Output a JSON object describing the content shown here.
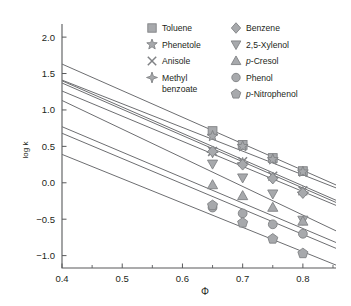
{
  "chart_data": {
    "type": "line",
    "title": "",
    "xlabel": "Φ",
    "ylabel": "log k",
    "xlim": [
      0.4,
      0.855
    ],
    "ylim": [
      -1.17,
      2.18
    ],
    "xticks": [
      0.4,
      0.5,
      0.6,
      0.7,
      0.8
    ],
    "xtick_labels": [
      "0.4",
      "0.5",
      "0.6",
      "0.7",
      "0.8"
    ],
    "xminor": [
      0.45,
      0.55,
      0.65,
      0.75,
      0.85
    ],
    "yticks": [
      -1.0,
      -0.5,
      0.0,
      0.5,
      1.0,
      1.5,
      2.0
    ],
    "ytick_labels": [
      "−1.0",
      "−0.5",
      "0.0",
      "0.5",
      "1.0",
      "1.5",
      "2.0"
    ],
    "grid": false,
    "legend_position": "top-right",
    "marker_x": [
      0.65,
      0.7,
      0.75,
      0.8
    ],
    "line_x_range": [
      0.4,
      0.855
    ],
    "series": [
      {
        "name": "Toluene",
        "marker": "square",
        "x": [
          0.65,
          0.7,
          0.75,
          0.8
        ],
        "values": [
          0.71,
          0.52,
          0.34,
          0.16
        ],
        "fit_endpoints": [
          1.63,
          -0.03
        ]
      },
      {
        "name": "Phenetole",
        "marker": "star",
        "x": [
          0.65,
          0.7,
          0.75,
          0.8
        ],
        "values": [
          0.64,
          0.5,
          0.32,
          0.15
        ],
        "fit_endpoints": [
          1.41,
          -0.07
        ]
      },
      {
        "name": "Anisole",
        "marker": "x",
        "x": [
          0.65,
          0.7,
          0.75,
          0.8
        ],
        "values": [
          0.43,
          0.29,
          0.09,
          -0.11
        ],
        "fit_endpoints": [
          1.4,
          -0.24
        ]
      },
      {
        "name": "Methyl benzoate",
        "marker": "four-point-star",
        "x": [
          0.65,
          0.7,
          0.75,
          0.8
        ],
        "values": [
          0.42,
          0.27,
          0.07,
          -0.13
        ],
        "fit_endpoints": [
          1.37,
          -0.27
        ]
      },
      {
        "name": "Benzene",
        "marker": "diamond",
        "x": [
          0.65,
          0.7,
          0.75,
          0.8
        ],
        "values": [
          0.43,
          0.25,
          0.06,
          -0.14
        ],
        "fit_endpoints": [
          1.26,
          -0.31
        ]
      },
      {
        "name": "2,5-Xylenol",
        "marker": "triangle-down",
        "x": [
          0.65,
          0.7,
          0.75,
          0.8
        ],
        "values": [
          0.26,
          0.07,
          -0.15,
          -0.51
        ],
        "fit_endpoints": [
          1.13,
          -0.66
        ]
      },
      {
        "name": "p-Cresol",
        "marker": "triangle-up",
        "x": [
          0.65,
          0.7,
          0.75,
          0.8
        ],
        "values": [
          -0.03,
          -0.18,
          -0.34,
          -0.53
        ],
        "fit_endpoints": [
          0.77,
          -0.82
        ]
      },
      {
        "name": "Phenol",
        "marker": "circle",
        "x": [
          0.65,
          0.7,
          0.75,
          0.8
        ],
        "values": [
          -0.34,
          -0.42,
          -0.57,
          -0.7
        ],
        "fit_endpoints": [
          0.68,
          -0.9
        ]
      },
      {
        "name": "p-Nitrophenol",
        "marker": "pentagon",
        "x": [
          0.65,
          0.7,
          0.75,
          0.8
        ],
        "values": [
          -0.31,
          -0.55,
          -0.77,
          -0.97
        ],
        "fit_endpoints": [
          0.39,
          -1.13
        ]
      }
    ]
  },
  "legend": {
    "columns": [
      {
        "items": [
          {
            "marker": "square",
            "label": "Toluene",
            "italic_prefix": "",
            "line2": ""
          },
          {
            "marker": "star",
            "label": "Phenetole",
            "italic_prefix": "",
            "line2": ""
          },
          {
            "marker": "x",
            "label": "Anisole",
            "italic_prefix": "",
            "line2": ""
          },
          {
            "marker": "four-point-star",
            "label": "Methyl",
            "italic_prefix": "",
            "line2": "benzoate"
          }
        ]
      },
      {
        "items": [
          {
            "marker": "diamond",
            "label": "Benzene",
            "italic_prefix": "",
            "line2": ""
          },
          {
            "marker": "triangle-down",
            "label": "2,5-Xylenol",
            "italic_prefix": "",
            "line2": ""
          },
          {
            "marker": "triangle-up",
            "label": "-Cresol",
            "italic_prefix": "p",
            "line2": ""
          },
          {
            "marker": "circle",
            "label": "Phenol",
            "italic_prefix": "",
            "line2": ""
          },
          {
            "marker": "pentagon",
            "label": "-Nitrophenol",
            "italic_prefix": "p",
            "line2": ""
          }
        ]
      }
    ]
  },
  "colors": {
    "axis": "#58595b",
    "line": "#6d6e71",
    "marker_fill": "#a7a9ac",
    "marker_stroke": "#808285",
    "text": "#231f20",
    "background": "#ffffff"
  }
}
